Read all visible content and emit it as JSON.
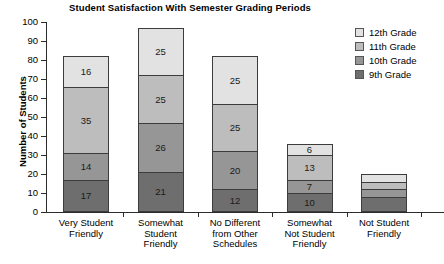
{
  "chart_data": {
    "type": "bar",
    "subtype": "stacked-bar",
    "title": "Student Satisfaction With Semester Grading Periods",
    "xlabel": "",
    "ylabel": "Number of Students",
    "ylim": [
      0,
      100
    ],
    "ytick_step": 10,
    "yticks": [
      0,
      10,
      20,
      30,
      40,
      50,
      60,
      70,
      80,
      90,
      100
    ],
    "grid": false,
    "legend_position": "right-top",
    "categories": [
      "Very Student Friendly",
      "Somewhat Student Friendly",
      "No Different from Other Schedules",
      "Somewhat Not Student Friendly",
      "Not Student Friendly"
    ],
    "series": [
      {
        "name": "9th Grade",
        "color": "#6e6e6e",
        "values": [
          17,
          21,
          12,
          10,
          8
        ],
        "labels": [
          "17",
          "21",
          "12",
          "10",
          ""
        ]
      },
      {
        "name": "10th Grade",
        "color": "#969696",
        "values": [
          14,
          26,
          20,
          7,
          4
        ],
        "labels": [
          "14",
          "26",
          "20",
          "7",
          ""
        ]
      },
      {
        "name": "11th Grade",
        "color": "#bdbdbd",
        "values": [
          35,
          25,
          25,
          13,
          4
        ],
        "labels": [
          "35",
          "25",
          "25",
          "13",
          ""
        ]
      },
      {
        "name": "12th Grade",
        "color": "#e2e2e2",
        "values": [
          16,
          25,
          25,
          6,
          4
        ],
        "labels": [
          "16",
          "25",
          "25",
          "6",
          ""
        ]
      }
    ],
    "totals": [
      82,
      97,
      82,
      36,
      20
    ]
  },
  "title": {
    "text": "Student Satisfaction With Semester Grading Periods"
  },
  "y_axis": {
    "title": "Number of Students",
    "ticks": [
      "100",
      "90",
      "80",
      "70",
      "60",
      "50",
      "40",
      "30",
      "20",
      "10",
      "0"
    ]
  },
  "x_axis": {
    "categories": [
      {
        "line1": "Very Student",
        "line2": "Friendly",
        "line3": "",
        "line4": ""
      },
      {
        "line1": "Somewhat",
        "line2": "Student",
        "line3": "Friendly",
        "line4": ""
      },
      {
        "line1": "No Different",
        "line2": "from Other",
        "line3": "Schedules",
        "line4": ""
      },
      {
        "line1": "Somewhat",
        "line2": "Not Student",
        "line3": "Friendly",
        "line4": ""
      },
      {
        "line1": "Not Student",
        "line2": "Friendly",
        "line3": "",
        "line4": ""
      }
    ]
  },
  "legend": {
    "items": [
      {
        "label": "12th Grade",
        "color": "#e2e2e2"
      },
      {
        "label": "11th Grade",
        "color": "#bdbdbd"
      },
      {
        "label": "10th Grade",
        "color": "#969696"
      },
      {
        "label": "9th Grade",
        "color": "#6e6e6e"
      }
    ]
  },
  "bars": [
    {
      "category": "Very Student Friendly",
      "total": 82,
      "segments": [
        {
          "grade": "9th Grade",
          "value": 17,
          "label": "17",
          "color": "#6e6e6e"
        },
        {
          "grade": "10th Grade",
          "value": 14,
          "label": "14",
          "color": "#969696"
        },
        {
          "grade": "11th Grade",
          "value": 35,
          "label": "35",
          "color": "#bdbdbd"
        },
        {
          "grade": "12th Grade",
          "value": 16,
          "label": "16",
          "color": "#e2e2e2"
        }
      ]
    },
    {
      "category": "Somewhat Student Friendly",
      "total": 97,
      "segments": [
        {
          "grade": "9th Grade",
          "value": 21,
          "label": "21",
          "color": "#6e6e6e"
        },
        {
          "grade": "10th Grade",
          "value": 26,
          "label": "26",
          "color": "#969696"
        },
        {
          "grade": "11th Grade",
          "value": 25,
          "label": "25",
          "color": "#bdbdbd"
        },
        {
          "grade": "12th Grade",
          "value": 25,
          "label": "25",
          "color": "#e2e2e2"
        }
      ]
    },
    {
      "category": "No Different from Other Schedules",
      "total": 82,
      "segments": [
        {
          "grade": "9th Grade",
          "value": 12,
          "label": "12",
          "color": "#6e6e6e"
        },
        {
          "grade": "10th Grade",
          "value": 20,
          "label": "20",
          "color": "#969696"
        },
        {
          "grade": "11th Grade",
          "value": 25,
          "label": "25",
          "color": "#bdbdbd"
        },
        {
          "grade": "12th Grade",
          "value": 25,
          "label": "25",
          "color": "#e2e2e2"
        }
      ]
    },
    {
      "category": "Somewhat Not Student Friendly",
      "total": 36,
      "segments": [
        {
          "grade": "9th Grade",
          "value": 10,
          "label": "10",
          "color": "#6e6e6e"
        },
        {
          "grade": "10th Grade",
          "value": 7,
          "label": "7",
          "color": "#969696"
        },
        {
          "grade": "11th Grade",
          "value": 13,
          "label": "13",
          "color": "#bdbdbd"
        },
        {
          "grade": "12th Grade",
          "value": 6,
          "label": "6",
          "color": "#e2e2e2"
        }
      ]
    },
    {
      "category": "Not Student Friendly",
      "total": 20,
      "segments": [
        {
          "grade": "9th Grade",
          "value": 8,
          "label": "",
          "color": "#6e6e6e"
        },
        {
          "grade": "10th Grade",
          "value": 4,
          "label": "",
          "color": "#969696"
        },
        {
          "grade": "11th Grade",
          "value": 4,
          "label": "",
          "color": "#bdbdbd"
        },
        {
          "grade": "12th Grade",
          "value": 4,
          "label": "",
          "color": "#e2e2e2"
        }
      ]
    }
  ]
}
